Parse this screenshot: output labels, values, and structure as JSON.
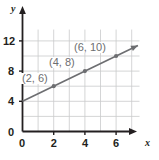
{
  "chart_data": {
    "type": "line",
    "title": "",
    "xlabel": "x",
    "ylabel": "y",
    "xlim": [
      0,
      7.5
    ],
    "ylim": [
      0,
      13.5
    ],
    "grid": true,
    "legend": null,
    "line": {
      "name": "y = x + 4",
      "slope": 1,
      "intercept": 4,
      "color": "#6d6e71",
      "arrow_end": true,
      "x_start": 0,
      "y_start": 4,
      "x_end": 7.4,
      "y_end": 11.4
    },
    "x_ticks": [
      {
        "value": 0,
        "label": "0"
      },
      {
        "value": 2,
        "label": "2"
      },
      {
        "value": 4,
        "label": "4"
      },
      {
        "value": 6,
        "label": "6"
      }
    ],
    "y_ticks": [
      {
        "value": 0,
        "label": "0"
      },
      {
        "value": 4,
        "label": "4"
      },
      {
        "value": 8,
        "label": "8"
      },
      {
        "value": 12,
        "label": "12"
      }
    ],
    "x_gridlines": [
      1,
      2,
      3,
      4,
      5,
      6,
      7
    ],
    "y_gridlines": [
      2,
      4,
      6,
      8,
      10,
      12
    ],
    "points": [
      {
        "x": 2,
        "y": 6,
        "label": "(2, 6)"
      },
      {
        "x": 4,
        "y": 8,
        "label": "(4, 8)"
      },
      {
        "x": 6,
        "y": 10,
        "label": "(6, 10)"
      }
    ],
    "point_color": "#6d6e71",
    "grid_color": "#c9cacc",
    "axis_color": "#231f20",
    "label_color": "#6d6e71"
  },
  "axis_labels": {
    "x": "x",
    "y": "y"
  }
}
